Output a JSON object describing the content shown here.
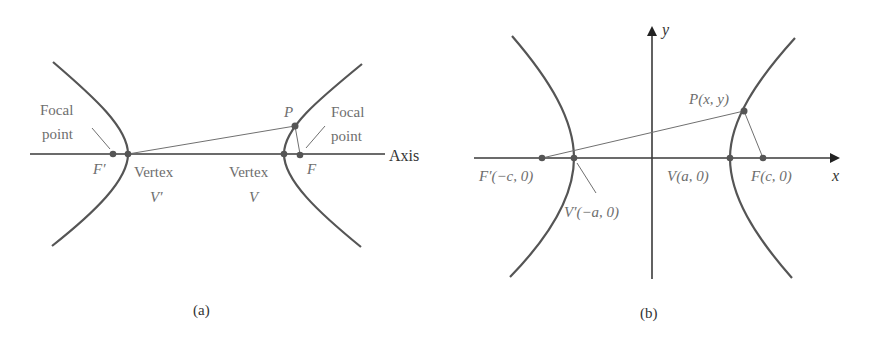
{
  "panel_a": {
    "caption": "(a)",
    "axis_label": "Axis",
    "focal_left_line1": "Focal",
    "focal_left_line2": "point",
    "focal_right_line1": "Focal",
    "focal_right_line2": "point",
    "f_prime": "F′",
    "f": "F",
    "vertex_left_line1": "Vertex",
    "vertex_left_line2": "V′",
    "vertex_right_line1": "Vertex",
    "vertex_right_line2": "V",
    "p": "P"
  },
  "panel_b": {
    "caption": "(b)",
    "x_axis_label": "x",
    "y_axis_label": "y",
    "f_prime": "F′(−c, 0)",
    "v_prime": "V′(−a, 0)",
    "v": "V(a, 0)",
    "f": "F(c, 0)",
    "p": "P(x, y)"
  }
}
